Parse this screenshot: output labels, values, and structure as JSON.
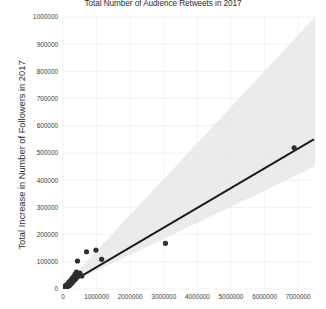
{
  "chart_data": {
    "type": "scatter",
    "title": "Total Number of Audience Retweets in 2017",
    "xlabel": "",
    "ylabel": "Total Increase in Number of Followers in 2017",
    "xlim": [
      0,
      7500000
    ],
    "ylim": [
      0,
      1000000
    ],
    "grid": true,
    "legend": "none",
    "xticks": [
      0,
      1000000,
      2000000,
      3000000,
      4000000,
      5000000,
      6000000,
      7000000
    ],
    "xtick_labels": [
      "0",
      "1000000",
      "2000000",
      "3000000",
      "4000000",
      "5000000",
      "6000000",
      "7000000"
    ],
    "yticks": [
      0,
      100000,
      200000,
      300000,
      400000,
      500000,
      600000,
      700000,
      800000,
      900000,
      1000000
    ],
    "ytick_labels": [
      "0",
      "100000",
      "200000",
      "300000",
      "400000",
      "500000",
      "600000",
      "700000",
      "800000",
      "900000",
      "1000000"
    ],
    "points": [
      {
        "x": 30000,
        "y": 5000
      },
      {
        "x": 55000,
        "y": 8000
      },
      {
        "x": 70000,
        "y": 12000
      },
      {
        "x": 90000,
        "y": 6000
      },
      {
        "x": 110000,
        "y": 15000
      },
      {
        "x": 130000,
        "y": 9000
      },
      {
        "x": 150000,
        "y": 20000
      },
      {
        "x": 165000,
        "y": 11000
      },
      {
        "x": 180000,
        "y": 25000
      },
      {
        "x": 200000,
        "y": 14000
      },
      {
        "x": 215000,
        "y": 30000
      },
      {
        "x": 230000,
        "y": 18000
      },
      {
        "x": 250000,
        "y": 35000
      },
      {
        "x": 265000,
        "y": 22000
      },
      {
        "x": 280000,
        "y": 40000
      },
      {
        "x": 300000,
        "y": 28000
      },
      {
        "x": 320000,
        "y": 46000
      },
      {
        "x": 340000,
        "y": 33000
      },
      {
        "x": 360000,
        "y": 55000
      },
      {
        "x": 380000,
        "y": 38000
      },
      {
        "x": 400000,
        "y": 62000
      },
      {
        "x": 420000,
        "y": 44000
      },
      {
        "x": 430000,
        "y": 103000
      },
      {
        "x": 460000,
        "y": 50000
      },
      {
        "x": 500000,
        "y": 58000
      },
      {
        "x": 560000,
        "y": 48000
      },
      {
        "x": 700000,
        "y": 137000
      },
      {
        "x": 980000,
        "y": 143000
      },
      {
        "x": 1150000,
        "y": 109000
      },
      {
        "x": 3050000,
        "y": 168000
      },
      {
        "x": 6880000,
        "y": 519000
      }
    ],
    "fit_line": {
      "x_start": 0,
      "y_start": 8000,
      "x_end": 7450000,
      "y_end": 549000,
      "slope": 0.0726,
      "intercept": 8000
    },
    "confidence_band": {
      "description": "95% confidence interval shading around regression fit, widening with x",
      "upper_at_xmax": 1000000,
      "lower_at_xmax": 450000
    }
  }
}
